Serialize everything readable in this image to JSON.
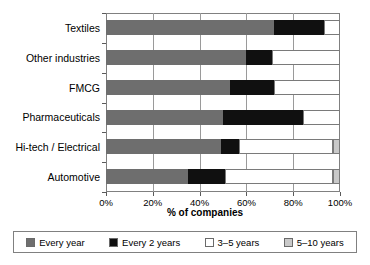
{
  "chart_data": {
    "type": "bar",
    "orientation": "horizontal",
    "stacked": true,
    "title": "",
    "xlabel": "% of companies",
    "ylabel": "",
    "xlim": [
      0,
      100
    ],
    "xticks": [
      "0%",
      "20%",
      "40%",
      "60%",
      "80%",
      "100%"
    ],
    "xtick_values": [
      0,
      20,
      40,
      60,
      80,
      100
    ],
    "grid": "vertical",
    "legend_position": "bottom",
    "categories": [
      "Textiles",
      "Other industries",
      "FMCG",
      "Pharmaceuticals",
      "Hi-tech / Electrical",
      "Automotive"
    ],
    "series": [
      {
        "name": "Every year",
        "color": "#6e6e6e",
        "values": [
          72,
          60,
          53,
          50,
          49,
          35
        ]
      },
      {
        "name": "Every 2 years",
        "color": "#101010",
        "values": [
          21,
          11,
          19,
          34,
          8,
          16
        ]
      },
      {
        "name": "3-5 years",
        "color": "#ffffff",
        "values": [
          7,
          29,
          28,
          16,
          40,
          46
        ]
      },
      {
        "name": "5-10 years",
        "color": "#c9c9c9",
        "values": [
          0,
          0,
          0,
          0,
          3,
          3
        ]
      }
    ],
    "legend": [
      {
        "label": "Every year",
        "color": "#6e6e6e"
      },
      {
        "label": "Every 2 years",
        "color": "#101010"
      },
      {
        "label": "3–5 years",
        "color": "#ffffff"
      },
      {
        "label": "5–10 years",
        "color": "#c9c9c9"
      }
    ]
  }
}
